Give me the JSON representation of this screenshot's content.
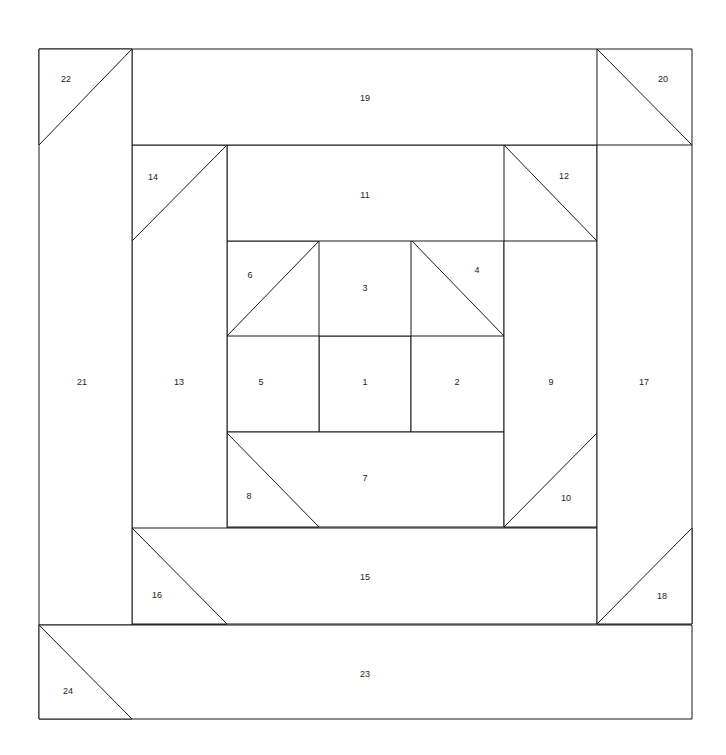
{
  "diagram": {
    "type": "quilt-block-piecing-diagram",
    "canvas": {
      "width": 726,
      "height": 755
    },
    "block_bounds": {
      "left": 39,
      "top": 49,
      "right": 692,
      "bottom": 719
    },
    "style": {
      "line_color": "#1a1a1a",
      "fill_color": "#ffffff",
      "background_color": "#ffffff",
      "label_color": "#1d1d1d",
      "line_width": 1,
      "label_font_size": 9
    },
    "piece_count": 24,
    "pieces": [
      {
        "number": "1",
        "shape": "rectangle",
        "points": "319,336 411,336 411,432 319,432",
        "label_x": 365,
        "label_y": 383
      },
      {
        "number": "2",
        "shape": "rectangle",
        "points": "411,336 504,336 504,432 411,432",
        "label_x": 457,
        "label_y": 383
      },
      {
        "number": "3",
        "shape": "rectangle",
        "points": "319,240 411,240 411,336 319,336",
        "label_x": 365,
        "label_y": 289
      },
      {
        "number": "4",
        "shape": "triangle",
        "points": "411,240 504,240 504,336",
        "label_x": 477,
        "label_y": 271
      },
      {
        "number": "5",
        "shape": "rectangle",
        "points": "227,336 319,336 319,432 227,432",
        "label_x": 261,
        "label_y": 383
      },
      {
        "number": "6",
        "shape": "triangle",
        "points": "227,241 319,241 227,336",
        "label_x": 250,
        "label_y": 276
      },
      {
        "number": "7",
        "shape": "rectangle",
        "points": "227,432 504,432 504,527 227,527",
        "label_x": 365,
        "label_y": 479
      },
      {
        "number": "8",
        "shape": "triangle",
        "points": "227,433 319,527 227,527",
        "label_x": 249,
        "label_y": 497
      },
      {
        "number": "9",
        "shape": "rectangle",
        "points": "504,241 597,241 597,527 504,527",
        "label_x": 551,
        "label_y": 383
      },
      {
        "number": "10",
        "shape": "triangle",
        "points": "504,527 597,433 597,527",
        "label_x": 566,
        "label_y": 499
      },
      {
        "number": "11",
        "shape": "rectangle",
        "points": "227,145 504,145 504,241 227,241",
        "label_x": 365,
        "label_y": 196
      },
      {
        "number": "12",
        "shape": "triangle",
        "points": "504,145 597,145 597,241",
        "label_x": 564,
        "label_y": 177
      },
      {
        "number": "13",
        "shape": "rectangle",
        "points": "132,145 227,145 227,624 132,624",
        "label_x": 179,
        "label_y": 383
      },
      {
        "number": "14",
        "shape": "triangle",
        "points": "132,145 227,145 132,241",
        "label_x": 153,
        "label_y": 178
      },
      {
        "number": "15",
        "shape": "rectangle",
        "points": "132,528 597,528 597,624 132,624",
        "label_x": 365,
        "label_y": 578
      },
      {
        "number": "16",
        "shape": "triangle",
        "points": "132,528 227,624 132,624",
        "label_x": 157,
        "label_y": 596
      },
      {
        "number": "17",
        "shape": "rectangle",
        "points": "597,145 692,145 692,624 597,624",
        "label_x": 644,
        "label_y": 383
      },
      {
        "number": "18",
        "shape": "triangle",
        "points": "597,624 692,528 692,624",
        "label_x": 662,
        "label_y": 597
      },
      {
        "number": "19",
        "shape": "rectangle",
        "points": "132,49 597,49 597,145 132,145",
        "label_x": 365,
        "label_y": 99
      },
      {
        "number": "20",
        "shape": "triangle",
        "points": "597,49 692,49 692,145",
        "label_x": 663,
        "label_y": 80
      },
      {
        "number": "21",
        "shape": "rectangle",
        "points": "39,49 132,49 132,625 39,625",
        "label_x": 82,
        "label_y": 383
      },
      {
        "number": "22",
        "shape": "triangle",
        "points": "39,49 132,49 39,145",
        "label_x": 66,
        "label_y": 80
      },
      {
        "number": "23",
        "shape": "rectangle",
        "points": "39,625 692,625 692,719 39,719",
        "label_x": 365,
        "label_y": 675
      },
      {
        "number": "24",
        "shape": "triangle",
        "points": "39,625 132,719 39,719",
        "label_x": 68,
        "label_y": 692
      }
    ]
  }
}
